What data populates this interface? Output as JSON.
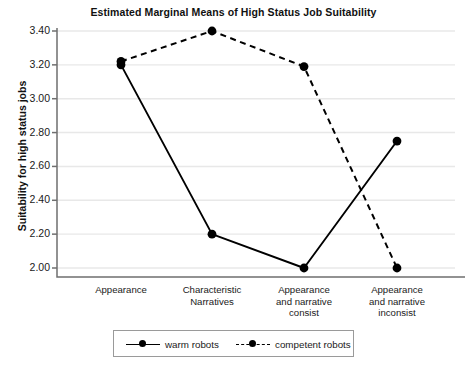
{
  "chart_data": {
    "type": "line",
    "title": "Estimated Marginal Means of High Status Job Suitability",
    "xlabel": "",
    "ylabel": "Suitability for high status jobs",
    "categories": [
      "Appearance",
      "Characteristic Narratives",
      "Appearance and narrative consist",
      "Appearance and narrative inconsist"
    ],
    "category_lines": [
      [
        "Appearance"
      ],
      [
        "Characteristic",
        "Narratives"
      ],
      [
        "Appearance",
        "and narrative",
        "consist"
      ],
      [
        "Appearance",
        "and narrative",
        "inconsist"
      ]
    ],
    "series": [
      {
        "name": "warm robots",
        "style": "solid",
        "marker": "circle",
        "values": [
          3.2,
          2.2,
          2.0,
          2.75
        ]
      },
      {
        "name": "competent robots",
        "style": "dashed",
        "marker": "circle",
        "values": [
          3.22,
          3.4,
          3.19,
          2.0
        ]
      }
    ],
    "ylim": [
      2.0,
      3.4
    ],
    "yticks": [
      3.4,
      3.2,
      3.0,
      2.8,
      2.6,
      2.4,
      2.2,
      2.0
    ],
    "ytick_labels": [
      "3.40",
      "3.20",
      "3.00",
      "2.80",
      "2.60",
      "2.40",
      "2.20",
      "2.00"
    ],
    "grid": true,
    "legend_position": "bottom",
    "colors": {
      "line": "#000000",
      "grid": "#e8e8e8",
      "axis": "#6f6f6f",
      "background": "#ffffff"
    }
  },
  "legend": {
    "items": [
      {
        "label": "warm robots"
      },
      {
        "label": "competent robots"
      }
    ]
  }
}
